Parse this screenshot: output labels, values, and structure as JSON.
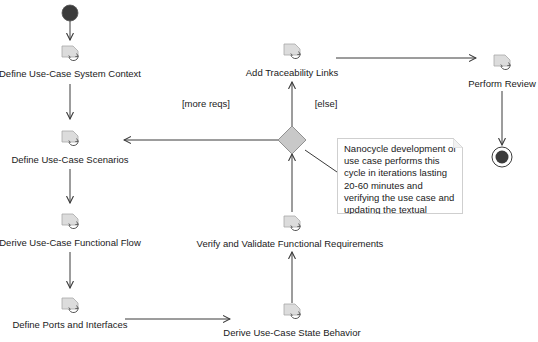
{
  "diagram": {
    "type": "UML activity diagram",
    "initial_node": "initial-node",
    "final_node": "activity-final-node",
    "actions": [
      {
        "id": "define-system-context",
        "label": "Define Use-Case System Context",
        "icon": "call-behavior-action-icon"
      },
      {
        "id": "define-scenarios",
        "label": "Define Use-Case Scenarios",
        "icon": "call-behavior-action-icon"
      },
      {
        "id": "derive-functional-flow",
        "label": "Derive Use-Case Functional Flow",
        "icon": "call-behavior-action-icon"
      },
      {
        "id": "define-ports",
        "label": "Define Ports and Interfaces",
        "icon": "call-behavior-action-icon"
      },
      {
        "id": "derive-state-behavior",
        "label": "Derive Use-Case State Behavior",
        "icon": "call-behavior-action-icon"
      },
      {
        "id": "verify-validate",
        "label": "Verify and Validate Functional Requirements",
        "icon": "call-behavior-action-icon"
      },
      {
        "id": "add-traceability",
        "label": "Add Traceability Links",
        "icon": "call-behavior-action-icon"
      },
      {
        "id": "perform-review",
        "label": "Perform Review",
        "icon": "call-behavior-action-icon"
      }
    ],
    "decision": {
      "id": "decision-node"
    },
    "guards": {
      "more_reqs": "[more reqs]",
      "else": "[else]"
    },
    "flows": [
      {
        "from": "initial-node",
        "to": "define-system-context"
      },
      {
        "from": "define-system-context",
        "to": "define-scenarios"
      },
      {
        "from": "define-scenarios",
        "to": "derive-functional-flow"
      },
      {
        "from": "derive-functional-flow",
        "to": "define-ports"
      },
      {
        "from": "define-ports",
        "to": "derive-state-behavior"
      },
      {
        "from": "derive-state-behavior",
        "to": "verify-validate"
      },
      {
        "from": "verify-validate",
        "to": "decision-node"
      },
      {
        "from": "decision-node",
        "to": "define-scenarios",
        "guard": "[more reqs]"
      },
      {
        "from": "decision-node",
        "to": "add-traceability",
        "guard": "[else]"
      },
      {
        "from": "add-traceability",
        "to": "perform-review"
      },
      {
        "from": "perform-review",
        "to": "activity-final-node"
      }
    ],
    "note": {
      "text": "Nanocycle development of use case performs this cycle in iterations lasting 20-60 minutes and verifying the use case and updating the textual requirements",
      "attached_to": "decision-node"
    },
    "colors": {
      "line": "#3a3a3a",
      "initial_fill": "#3b3b3b",
      "decision_fill": "#c8c8c8",
      "icon_fill": "#d9d9d9"
    }
  }
}
